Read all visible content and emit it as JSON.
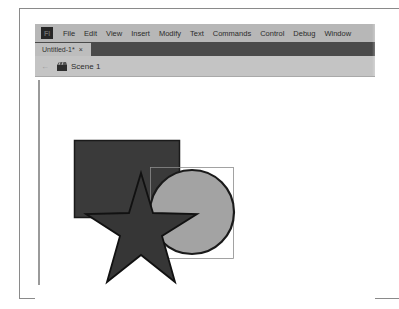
{
  "app": {
    "logo_text": "Fl",
    "menu": [
      "File",
      "Edit",
      "View",
      "Insert",
      "Modify",
      "Text",
      "Commands",
      "Control",
      "Debug",
      "Window"
    ]
  },
  "document": {
    "tab_label": "Untitled-1*",
    "tab_close": "×"
  },
  "scene": {
    "back_icon": "←",
    "label": "Scene 1"
  },
  "stage": {
    "shapes": [
      {
        "type": "rectangle",
        "fill": "#3a3a3a",
        "stroke": "#1a1a1a"
      },
      {
        "type": "circle",
        "fill": "#a3a3a3",
        "stroke": "#1a1a1a",
        "selected": true
      },
      {
        "type": "star",
        "fill": "#363636",
        "stroke": "#111111"
      }
    ]
  },
  "colors": {
    "menubar": "#b7b7b7",
    "tabbar": "#4a4a4a",
    "scenebar": "#c4c4c4"
  }
}
